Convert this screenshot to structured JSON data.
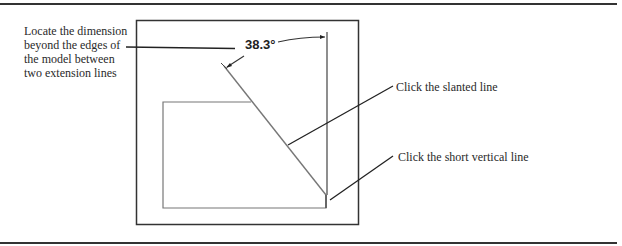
{
  "figure": {
    "dimension_value": "38.3°",
    "callouts": {
      "locate_dimension": "Locate the dimension beyond the edges of the model between two extension lines",
      "slanted_line": "Click the slanted line",
      "short_vertical_line": "Click the short vertical line"
    },
    "colors": {
      "frame": "#333333",
      "model_edges": "#777777",
      "leader": "#222222",
      "text": "#2a2a2a"
    }
  }
}
